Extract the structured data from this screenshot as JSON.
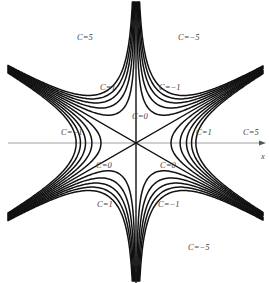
{
  "diagram": {
    "type": "contour-plot",
    "function": "C = x(x^2 - 3y^2)",
    "axes": {
      "x_label": "x",
      "y_label": "y"
    },
    "origin_px": [
      136,
      143
    ],
    "contour_levels": [
      -5,
      -4,
      -3,
      -2,
      -1,
      0,
      1,
      2,
      3,
      4,
      5
    ],
    "line_color": "#111111",
    "axis_color": "#777777"
  },
  "labels": [
    {
      "id": "top-left-c5",
      "text": "C=5",
      "x": 77,
      "y": 33
    },
    {
      "id": "top-right-cm5",
      "text": "C=−5",
      "x": 178,
      "y": 33
    },
    {
      "id": "upper-left-c1",
      "text": "C=1",
      "x": 100,
      "y": 83
    },
    {
      "id": "upper-right-cm1",
      "text": "C=−1",
      "x": 159,
      "y": 83
    },
    {
      "id": "upper-c0",
      "text": "C=0",
      "x": 132,
      "y": 112
    },
    {
      "id": "left-cm1",
      "text": "C=−1",
      "x": 61,
      "y": 128
    },
    {
      "id": "right-c1",
      "text": "C=1",
      "x": 196,
      "y": 128
    },
    {
      "id": "right-c5",
      "text": "C=5",
      "x": 243,
      "y": 128
    },
    {
      "id": "lower-left-c0",
      "text": "C=0",
      "x": 96,
      "y": 161
    },
    {
      "id": "lower-right-c0",
      "text": "C=0",
      "x": 160,
      "y": 161
    },
    {
      "id": "lower-left-c1",
      "text": "C=1",
      "x": 97,
      "y": 200
    },
    {
      "id": "lower-right-cm1",
      "text": "C=−1",
      "x": 158,
      "y": 200
    },
    {
      "id": "bottom-right-cm5",
      "text": "C=−5",
      "x": 188,
      "y": 243
    },
    {
      "id": "x-axis-label",
      "text": "x",
      "x": 261,
      "y": 152
    }
  ]
}
